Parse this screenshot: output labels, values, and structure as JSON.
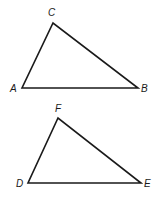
{
  "diagram": {
    "triangles": [
      {
        "name": "ABC",
        "vertices": {
          "A": {
            "label": "A",
            "x": 22,
            "y": 88
          },
          "B": {
            "label": "B",
            "x": 138,
            "y": 88
          },
          "C": {
            "label": "C",
            "x": 53,
            "y": 23
          }
        }
      },
      {
        "name": "DEF",
        "vertices": {
          "D": {
            "label": "D",
            "x": 28,
            "y": 183
          },
          "E": {
            "label": "E",
            "x": 141,
            "y": 183
          },
          "F": {
            "label": "F",
            "x": 58,
            "y": 118
          }
        }
      }
    ],
    "stroke_color": "#1a1a1a"
  }
}
